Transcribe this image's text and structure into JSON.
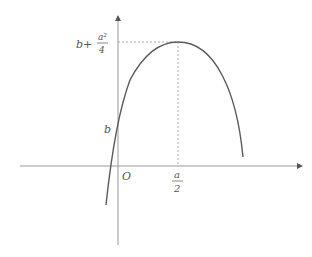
{
  "diagram": {
    "type": "parabola-graph",
    "origin_label": "O",
    "y_intercept_label": "b",
    "vertex_x_label": {
      "numerator": "a",
      "denominator": "2"
    },
    "vertex_y_label": {
      "prefix": "b+",
      "numerator": "a²",
      "denominator": "4"
    },
    "colors": {
      "axis": "#9a9a9a",
      "curve": "#5a5a5a",
      "guide": "#999999",
      "text": "#555555"
    }
  }
}
